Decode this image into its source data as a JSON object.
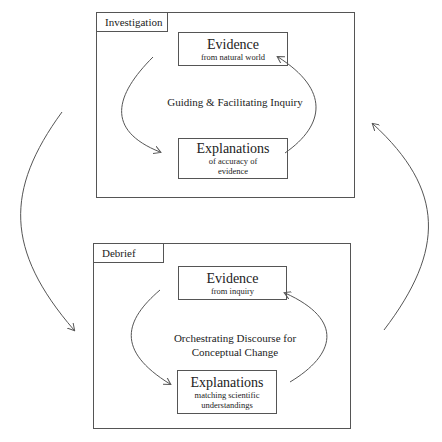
{
  "investigation": {
    "label": "Investigation",
    "evidence": {
      "title": "Evidence",
      "subtitle": "from natural world"
    },
    "explanations": {
      "title": "Explanations",
      "subtitle_line1": "of accuracy of",
      "subtitle_line2": "evidence"
    },
    "caption": "Guiding & Facilitating Inquiry"
  },
  "debrief": {
    "label": "Debrief",
    "evidence": {
      "title": "Evidence",
      "subtitle": "from inquiry"
    },
    "explanations": {
      "title": "Explanations",
      "subtitle_line1": "matching scientific",
      "subtitle_line2": "understandings"
    },
    "caption_line1": "Orchestrating Discourse for",
    "caption_line2": "Conceptual Change"
  },
  "colors": {
    "line": "#555555",
    "text": "#222222",
    "background": "#ffffff"
  }
}
